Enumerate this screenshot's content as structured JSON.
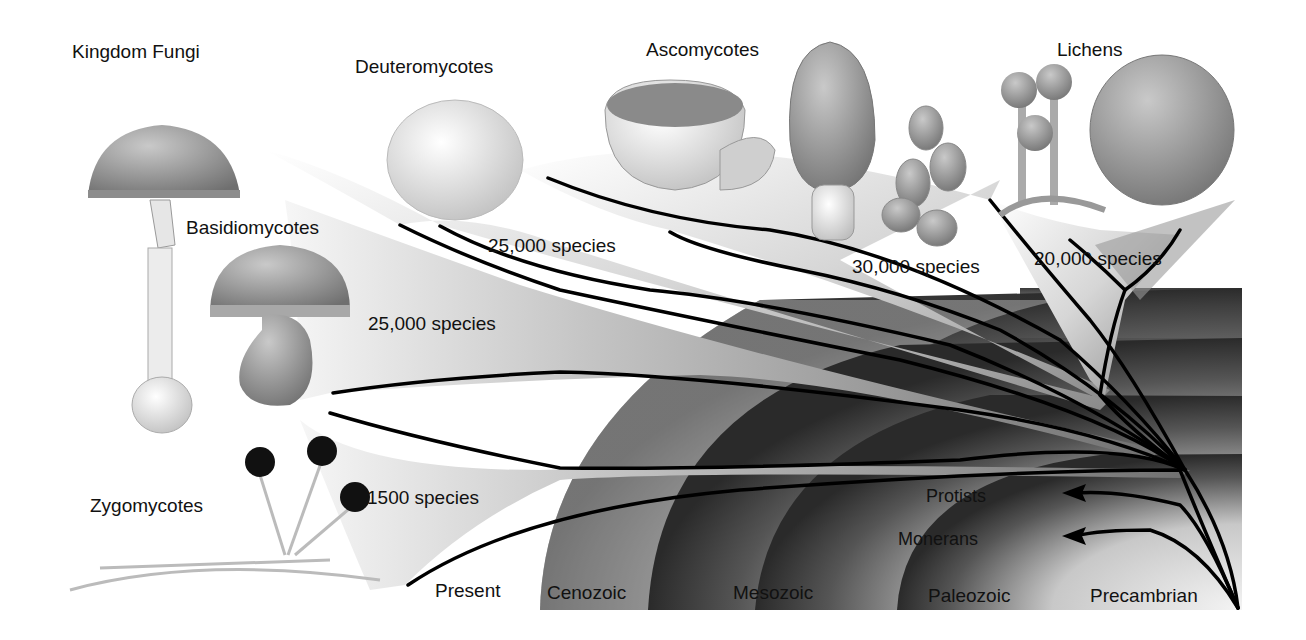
{
  "title": "Kingdom Fungi",
  "groups": [
    {
      "name": "Deuteromycotes",
      "species": "25,000 species"
    },
    {
      "name": "Ascomycotes",
      "species": "30,000 species"
    },
    {
      "name": "Lichens",
      "species": "20,000 species"
    },
    {
      "name": "Basidiomycotes",
      "species": "25,000 species"
    },
    {
      "name": "Zygomycotes",
      "species": "1500 species"
    }
  ],
  "outgroups": [
    {
      "name": "Protists"
    },
    {
      "name": "Monerans"
    }
  ],
  "eras": [
    {
      "name": "Present"
    },
    {
      "name": "Cenozoic"
    },
    {
      "name": "Mesozoic"
    },
    {
      "name": "Paleozoic"
    },
    {
      "name": "Precambrian"
    }
  ],
  "colors": {
    "background": "#ffffff",
    "text": "#111111",
    "branch_line": "#000000",
    "fan_dark": "#6e6e6e",
    "fan_light": "#f2f2f2",
    "era_band_dark": "#3a3a3a",
    "era_band_light": "#eeeeee"
  }
}
